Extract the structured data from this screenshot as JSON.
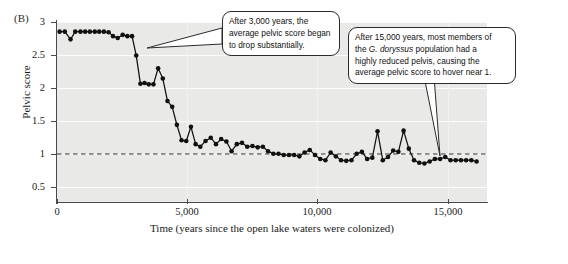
{
  "figure": {
    "panel_letter": "(B)"
  },
  "chart_data": {
    "type": "line",
    "title": "",
    "xlabel": "Time (years since the open lake waters were colonized)",
    "ylabel": "Pelvic score",
    "xlim": [
      0,
      16500
    ],
    "ylim": [
      0.35,
      3.15
    ],
    "grid": true,
    "legend": "none",
    "xticks": [
      0,
      5000,
      10000,
      15000
    ],
    "xticklabels": [
      "0",
      "5,000",
      "10,000",
      "15,000"
    ],
    "yticks": [
      0.5,
      1,
      1.5,
      2,
      2.5,
      3
    ],
    "yticklabels": [
      "0.5",
      "1",
      "1.5",
      "2",
      "2.5",
      "3"
    ],
    "reference_line": {
      "y": 1,
      "style": "dashed",
      "label": ""
    },
    "marker": "filled-circle",
    "series": [
      {
        "name": "average pelvic score",
        "x": [
          100,
          300,
          520,
          700,
          900,
          1080,
          1260,
          1450,
          1620,
          1800,
          1980,
          2150,
          2330,
          2520,
          2700,
          2880,
          3040,
          3200,
          3360,
          3520,
          3700,
          3880,
          4060,
          4240,
          4420,
          4600,
          4780,
          4960,
          5140,
          5320,
          5500,
          5700,
          5900,
          6100,
          6300,
          6500,
          6700,
          6900,
          7100,
          7300,
          7500,
          7700,
          7900,
          8100,
          8300,
          8500,
          8700,
          8900,
          9100,
          9300,
          9500,
          9700,
          9900,
          10100,
          10300,
          10500,
          10700,
          10900,
          11100,
          11300,
          11500,
          11700,
          11900,
          12100,
          12300,
          12500,
          12700,
          12900,
          13100,
          13300,
          13500,
          13700,
          13900,
          14100,
          14300,
          14500,
          14700,
          14900,
          15100,
          15300,
          15500,
          15700,
          15900,
          16100
        ],
        "values": [
          3.0,
          3.0,
          2.88,
          3.0,
          3.0,
          3.0,
          3.0,
          3.0,
          3.0,
          3.0,
          2.99,
          2.93,
          2.9,
          2.95,
          2.93,
          2.93,
          2.63,
          2.19,
          2.2,
          2.18,
          2.18,
          2.43,
          2.27,
          1.92,
          1.83,
          1.55,
          1.31,
          1.3,
          1.52,
          1.25,
          1.21,
          1.3,
          1.35,
          1.25,
          1.33,
          1.29,
          1.14,
          1.25,
          1.27,
          1.21,
          1.22,
          1.2,
          1.21,
          1.14,
          1.1,
          1.1,
          1.08,
          1.08,
          1.08,
          1.06,
          1.12,
          1.16,
          1.08,
          1.02,
          1.0,
          1.12,
          1.06,
          1.0,
          0.99,
          1.0,
          1.1,
          1.13,
          1.02,
          1.04,
          1.45,
          1.0,
          1.05,
          1.15,
          1.13,
          1.46,
          1.18,
          1.0,
          0.96,
          0.95,
          0.98,
          1.02,
          1.02,
          1.05,
          1.0,
          1.0,
          1.0,
          1.0,
          1.0,
          0.98
        ]
      }
    ],
    "annotations": [
      {
        "id": "callout-3000-years",
        "text_lines": [
          "After 3,000 years, the",
          "average pelvic score began",
          "to drop substantially."
        ],
        "points_to_x": 3040,
        "points_to_y": 2.63
      },
      {
        "id": "callout-15000-years",
        "text_lines": [
          "After 15,000 years, most members of",
          "the G. doryssus population had a",
          "highly reduced pelvis, causing the",
          "average pelvic score to hover near 1."
        ],
        "italic_term": "G. doryssus",
        "points_to_x": 15100,
        "points_to_y": 1.0
      }
    ]
  }
}
